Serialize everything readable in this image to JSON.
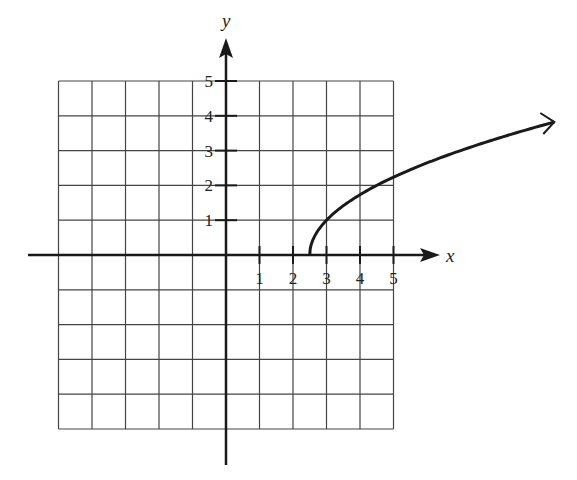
{
  "chart_data": {
    "type": "line",
    "title": "",
    "xlabel": "x",
    "ylabel": "y",
    "xlim": [
      -5,
      5
    ],
    "ylim": [
      -5,
      5
    ],
    "grid": true,
    "x_tick_labels": [
      "1",
      "2",
      "3",
      "4",
      "5"
    ],
    "y_tick_labels": [
      "1",
      "2",
      "3",
      "4",
      "5"
    ],
    "series": [
      {
        "name": "curve",
        "description": "square-root shaped curve starting at (2.5, 0), arrow to the right",
        "x": [
          2.5,
          3,
          3.5,
          4,
          4.5,
          5,
          6,
          7,
          8,
          9,
          9.8
        ],
        "y": [
          0,
          1,
          1.41,
          1.73,
          2,
          2.24,
          2.65,
          3,
          3.32,
          3.61,
          3.85
        ]
      }
    ]
  },
  "labels": {
    "x_axis": "x",
    "y_axis": "y",
    "x_ticks": [
      "1",
      "2",
      "3",
      "4",
      "5"
    ],
    "y_ticks": [
      "1",
      "2",
      "3",
      "4",
      "5"
    ]
  }
}
